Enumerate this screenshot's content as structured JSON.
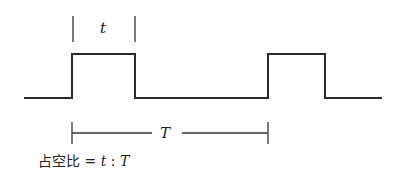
{
  "diagram": {
    "pulse_width_label": "t",
    "period_label": "T",
    "formula": {
      "prefix": "占空比",
      "equals": "=",
      "numerator": "t",
      "separator": ":",
      "denominator": "T"
    }
  }
}
